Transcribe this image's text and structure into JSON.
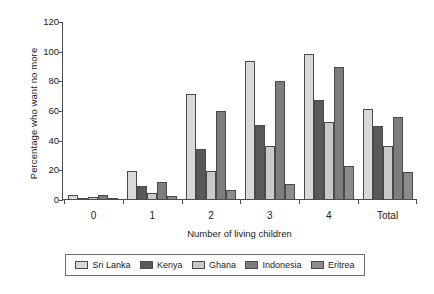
{
  "chart_data": {
    "type": "bar",
    "title": "",
    "xlabel": "Number of living children",
    "ylabel": "Percentage who want no more",
    "categories": [
      "0",
      "1",
      "2",
      "3",
      "4",
      "Total"
    ],
    "ylim": [
      0,
      120
    ],
    "yticks": [
      0,
      20,
      40,
      60,
      80,
      100,
      120
    ],
    "grid": false,
    "legend_position": "bottom",
    "series": [
      {
        "name": "Sri Lanka",
        "color": "#d9d9d9",
        "values": [
          2.5,
          19.0,
          71.0,
          93.0,
          97.5,
          60.5
        ]
      },
      {
        "name": "Kenya",
        "color": "#595959",
        "values": [
          0.8,
          9.0,
          33.5,
          50.0,
          67.0,
          49.0
        ]
      },
      {
        "name": "Ghana",
        "color": "#c9c9c9",
        "values": [
          1.5,
          4.0,
          19.0,
          35.5,
          52.0,
          36.0
        ]
      },
      {
        "name": "Indonesia",
        "color": "#7d7d7d",
        "values": [
          2.5,
          11.5,
          59.0,
          79.5,
          89.0,
          55.0
        ]
      },
      {
        "name": "Eritrea",
        "color": "#8c8c8c",
        "values": [
          0.8,
          2.0,
          6.0,
          10.0,
          22.5,
          18.0
        ]
      }
    ]
  }
}
